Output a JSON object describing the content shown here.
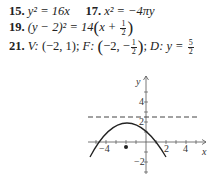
{
  "answers": [
    {
      "num": "15.",
      "text": "y² = 16x"
    },
    {
      "num": "17.",
      "text": "x² = −4πy"
    },
    {
      "num": "19.",
      "text_before": "(y − 2)² = 14",
      "paren_open": "(",
      "inner": "x + ",
      "frac_num": "1",
      "frac_den": "2",
      "paren_close": ")"
    },
    {
      "num": "21.",
      "vertex_label": "V:",
      "vertex": "(−2, 1);",
      "focus_label": "F:",
      "focus_pre": "−2, −",
      "focus_frac_num": "1",
      "focus_frac_den": "2",
      "focus_post": ";",
      "directrix_label": "D:",
      "directrix_eq": "y = ",
      "directrix_frac_num": "5",
      "directrix_frac_den": "2"
    }
  ],
  "graph": {
    "x_axis_label": "x",
    "y_axis_label": "y",
    "x_tick_labels": [
      "−4",
      "2",
      "4"
    ],
    "y_tick_labels": [
      "4",
      "2",
      "−2"
    ],
    "vertex": [
      -2,
      1
    ],
    "focus": [
      -2,
      -0.5
    ],
    "directrix_y": 2.5,
    "curve": "(x+2)^2 = -6(y-1)",
    "colors": {
      "curve": "#222222",
      "axis": "#555555",
      "dashed": "#444444"
    }
  }
}
